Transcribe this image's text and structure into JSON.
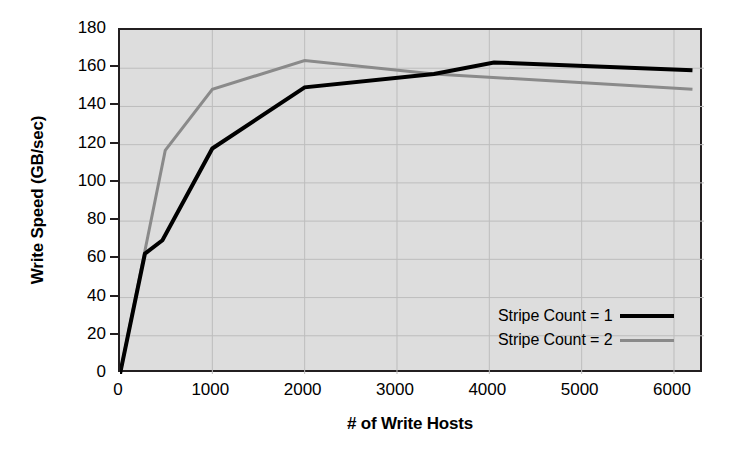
{
  "chart_data": {
    "type": "line",
    "title": "",
    "xlabel": "# of Write Hosts",
    "ylabel": "Write Speed (GB/sec)",
    "xlim": [
      0,
      6325
    ],
    "ylim": [
      0,
      180
    ],
    "xticks": [
      0,
      1000,
      2000,
      3000,
      4000,
      5000,
      6000
    ],
    "xtick_labels": [
      "0",
      "1000",
      "2000",
      "3000",
      "4000",
      "5000",
      "6000"
    ],
    "yticks": [
      0,
      20,
      40,
      60,
      80,
      100,
      120,
      140,
      160,
      180
    ],
    "ytick_labels": [
      "0",
      "20",
      "40",
      "60",
      "80",
      "100",
      "120",
      "140",
      "160",
      "180"
    ],
    "grid": true,
    "legend_position": "lower-right-inside",
    "plot_background": "#dddddd",
    "grid_color": "#bdbdbd",
    "frame_color": "#231f20",
    "series": [
      {
        "name": "Stripe Count = 1",
        "color": "#000000",
        "width": 4,
        "x": [
          0,
          270,
          460,
          1000,
          2000,
          3400,
          4050,
          6200
        ],
        "y": [
          0,
          63,
          70,
          118,
          150,
          157,
          163,
          159
        ]
      },
      {
        "name": "Stripe Count = 2",
        "color": "#8a8a8a",
        "width": 3,
        "x": [
          0,
          490,
          1000,
          2000,
          3400,
          6200
        ],
        "y": [
          0,
          117,
          149,
          164,
          157,
          149
        ]
      }
    ]
  },
  "legend": {
    "items": [
      {
        "label": "Stripe Count = 1",
        "style": "sw-black"
      },
      {
        "label": "Stripe Count = 2",
        "style": "sw-gray"
      }
    ]
  }
}
